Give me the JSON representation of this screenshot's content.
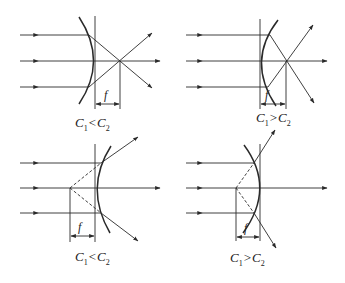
{
  "figure": {
    "panels": [
      {
        "id": "top-left",
        "type": "converging",
        "focal_label": "f",
        "caption": {
          "c1": "C",
          "c1_sub": "1",
          "op": "<",
          "c2": "C",
          "c2_sub": "2"
        }
      },
      {
        "id": "top-right",
        "type": "converging",
        "focal_label": "f",
        "caption": {
          "c1": "C",
          "c1_sub": "1",
          "op": ">",
          "c2": "C",
          "c2_sub": "2"
        }
      },
      {
        "id": "bottom-left",
        "type": "diverging",
        "focal_label": "f",
        "caption": {
          "c1": "C",
          "c1_sub": "1",
          "op": "<",
          "c2": "C",
          "c2_sub": "2"
        }
      },
      {
        "id": "bottom-right",
        "type": "diverging",
        "focal_label": "f",
        "caption": {
          "c1": "C",
          "c1_sub": "1",
          "op": ">",
          "c2": "C",
          "c2_sub": "2"
        }
      }
    ],
    "colors": {
      "line": "#2a2a2a",
      "background": "#ffffff"
    }
  }
}
